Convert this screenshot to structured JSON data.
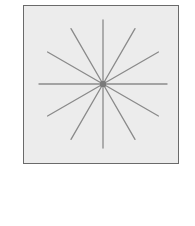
{
  "diagram": {
    "type": "radial-star",
    "ray_count": 12,
    "ray_angle_step_deg": 30,
    "center": {
      "x": 79,
      "y": 78
    },
    "ray_length": 64,
    "hub_size": 6,
    "colors": {
      "background": "#ececec",
      "border": "#6a6a6a",
      "ray": "#8a8a8a",
      "hub": "#7a7a7a"
    }
  }
}
